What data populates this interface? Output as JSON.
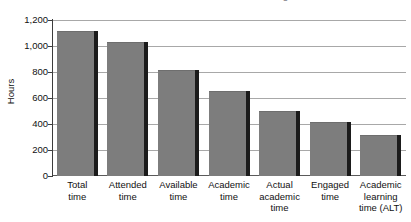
{
  "chart_data": {
    "type": "bar",
    "title": "Time Available for Academic Learning",
    "xlabel": "",
    "ylabel": "Hours",
    "ylim": [
      0,
      1200
    ],
    "ytick_step": 200,
    "grid": true,
    "legend": "none",
    "bar_color": "#7d7d7d",
    "categories": [
      "Total time",
      "Attended time",
      "Available time",
      "Academic time",
      "Actual academic time",
      "Engaged time",
      "Academic learning time (ALT)"
    ],
    "category_lines": [
      [
        "Total",
        "time"
      ],
      [
        "Attended",
        "time"
      ],
      [
        "Available",
        "time"
      ],
      [
        "Academic",
        "time"
      ],
      [
        "Actual",
        "academic",
        "time"
      ],
      [
        "Engaged",
        "time"
      ],
      [
        "Academic",
        "learning",
        "time (ALT)"
      ]
    ],
    "values": [
      1115,
      1030,
      815,
      655,
      500,
      415,
      315
    ],
    "ytick_labels": [
      "1,200",
      "1,000",
      "800",
      "600",
      "400",
      "200",
      "0"
    ],
    "ytick_values": [
      1200,
      1000,
      800,
      600,
      400,
      200,
      0
    ]
  }
}
